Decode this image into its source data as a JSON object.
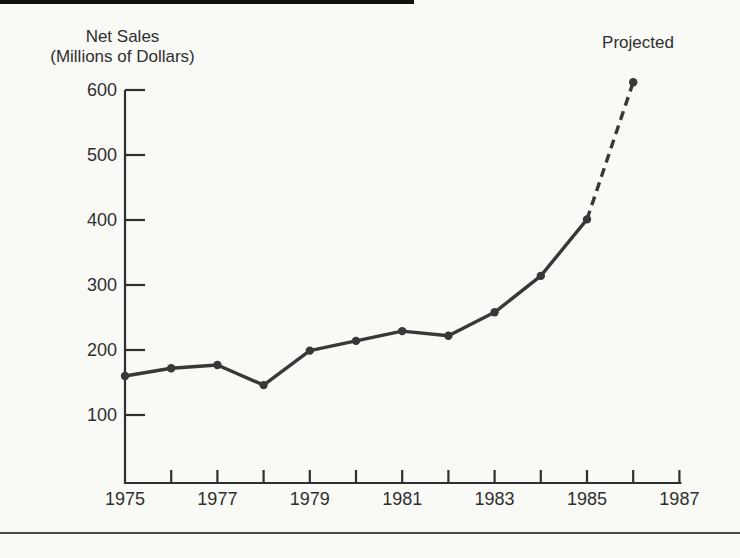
{
  "page": {
    "background": "#f9f9f6"
  },
  "chart_data": {
    "type": "line",
    "title_lines": [
      "Net Sales",
      "(Millions of Dollars)"
    ],
    "annotation": "Projected",
    "ylabel": "Net Sales (Millions of Dollars)",
    "x": [
      1975,
      1976,
      1977,
      1978,
      1979,
      1980,
      1981,
      1982,
      1983,
      1984,
      1985,
      1986
    ],
    "values": [
      160,
      172,
      177,
      146,
      199,
      214,
      229,
      222,
      258,
      314,
      401,
      612
    ],
    "solid_through_x": 1985,
    "projected_x": 1986,
    "projected_value": 612,
    "x_ticks": [
      1976,
      1977,
      1978,
      1979,
      1980,
      1981,
      1982,
      1983,
      1984,
      1985,
      1986,
      1987
    ],
    "x_tick_label_years": [
      1975,
      1977,
      1979,
      1981,
      1983,
      1985,
      1987
    ],
    "y_ticks": [
      100,
      200,
      300,
      400,
      500,
      600
    ],
    "xlim": [
      1975,
      1987
    ],
    "ylim": [
      0,
      620
    ],
    "grid": false,
    "legend": "none",
    "marker": "filled-circle",
    "colors": {
      "line": "#383838",
      "axis": "#2f2f2f",
      "text": "#2f2f2f",
      "page_background": "#f9f9f6",
      "top_bar": "#121212",
      "bottom_rule": "#4a4a4a"
    }
  }
}
